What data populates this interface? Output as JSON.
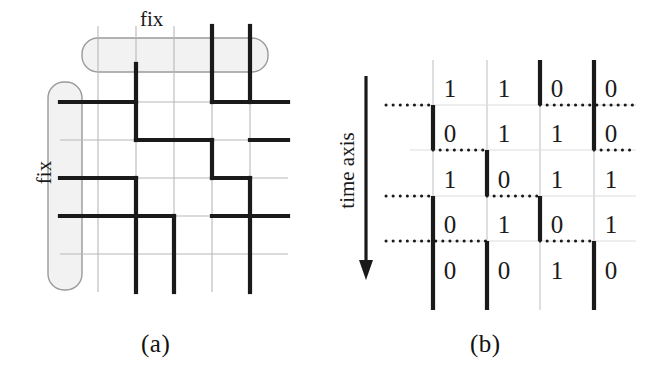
{
  "figure": {
    "caption_a": "(a)",
    "caption_b": "(b)"
  },
  "panel_a": {
    "label_top": "fix",
    "label_left": "fix",
    "grid": {
      "cols": 5,
      "rows": 5,
      "cell": 38,
      "origin_x": 60,
      "origin_y": 64
    },
    "colors": {
      "thin_grid": "#b8b8b8",
      "bold_path": "#1a1a1a",
      "fix_box_fill": "#f2f2f2",
      "fix_box_stroke": "#9a9a9a"
    },
    "fix_box_top": {
      "x": 82,
      "y": 38,
      "w": 186,
      "h": 34
    },
    "fix_box_left": {
      "x": 48,
      "y": 82,
      "w": 34,
      "h": 208
    },
    "thin_vertical_x": [
      98,
      136,
      174,
      212,
      250
    ],
    "thin_horizontal_y": [
      102,
      140,
      178,
      216,
      254
    ],
    "bold_segments": [
      {
        "type": "h",
        "x1": 60,
        "x2": 136,
        "y": 102
      },
      {
        "type": "v",
        "x": 136,
        "y1": 64,
        "y2": 140
      },
      {
        "type": "h",
        "x1": 136,
        "x2": 212,
        "y": 140
      },
      {
        "type": "v",
        "x": 212,
        "y1": 140,
        "y2": 178
      },
      {
        "type": "h",
        "x1": 212,
        "x2": 250,
        "y": 178
      },
      {
        "type": "v",
        "x": 250,
        "y1": 178,
        "y2": 216
      },
      {
        "type": "h",
        "x1": 60,
        "x2": 136,
        "y": 178
      },
      {
        "type": "v",
        "x": 136,
        "y1": 178,
        "y2": 292
      },
      {
        "type": "h",
        "x1": 60,
        "x2": 174,
        "y": 216
      },
      {
        "type": "v",
        "x": 174,
        "y1": 216,
        "y2": 292
      },
      {
        "type": "h",
        "x1": 212,
        "x2": 288,
        "y": 216
      },
      {
        "type": "v",
        "x": 212,
        "y1": 26,
        "y2": 102
      },
      {
        "type": "h",
        "x1": 212,
        "x2": 288,
        "y": 102
      },
      {
        "type": "v",
        "x": 250,
        "y1": 26,
        "y2": 102
      },
      {
        "type": "h",
        "x1": 250,
        "x2": 288,
        "y": 140
      },
      {
        "type": "v",
        "x": 250,
        "y1": 216,
        "y2": 292
      }
    ]
  },
  "panel_b": {
    "axis_label": "time axis",
    "arrow": {
      "x": 366,
      "y_top": 76,
      "y_bottom": 276
    },
    "colors": {
      "thin_grid": "#c4c4c4",
      "bold_line": "#1a1a1a",
      "dotted": "#1a1a1a"
    },
    "grid": {
      "cols": 4,
      "rows": 5,
      "col_x": [
        433,
        487,
        540,
        594
      ],
      "row_y": [
        105,
        150,
        196,
        241,
        287
      ]
    },
    "matrix": [
      [
        "1",
        "1",
        "0",
        "0"
      ],
      [
        "0",
        "1",
        "1",
        "0"
      ],
      [
        "1",
        "0",
        "1",
        "1"
      ],
      [
        "0",
        "1",
        "0",
        "1"
      ],
      [
        "0",
        "0",
        "1",
        "0"
      ]
    ],
    "thin_vertical_x": [
      433,
      487,
      540,
      594
    ],
    "thin_horizontal_y": [
      105,
      150,
      196,
      241
    ],
    "bold_vertical_segments": [
      {
        "x": 540,
        "y1": 60,
        "y2": 105
      },
      {
        "x": 594,
        "y1": 60,
        "y2": 150
      },
      {
        "x": 433,
        "y1": 105,
        "y2": 150
      },
      {
        "x": 487,
        "y1": 150,
        "y2": 196
      },
      {
        "x": 433,
        "y1": 196,
        "y2": 310
      },
      {
        "x": 540,
        "y1": 196,
        "y2": 241
      },
      {
        "x": 487,
        "y1": 241,
        "y2": 310
      },
      {
        "x": 594,
        "y1": 241,
        "y2": 310
      }
    ],
    "dotted_segments": [
      {
        "y": 105,
        "x1": 386,
        "x2": 433
      },
      {
        "y": 105,
        "x1": 540,
        "x2": 636
      },
      {
        "y": 150,
        "x1": 433,
        "x2": 487
      },
      {
        "y": 150,
        "x1": 594,
        "x2": 636
      },
      {
        "y": 196,
        "x1": 386,
        "x2": 433
      },
      {
        "y": 196,
        "x1": 487,
        "x2": 540
      },
      {
        "y": 241,
        "x1": 386,
        "x2": 487
      },
      {
        "y": 241,
        "x1": 540,
        "x2": 594
      }
    ]
  }
}
